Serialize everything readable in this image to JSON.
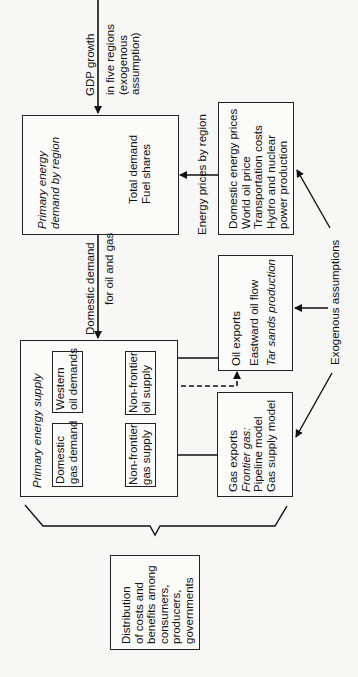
{
  "diagram": {
    "orientation": "rotated-90-counterclockwise",
    "gdp_input": {
      "lines": [
        "GDP growth",
        "in five regions",
        "(exogenous",
        "assumption)"
      ]
    },
    "primary_demand_box": {
      "title_lines": [
        "Primary energy",
        "demand by region"
      ],
      "body_lines": [
        "Total demand",
        "Fuel shares"
      ]
    },
    "energy_prices_label": "Energy prices by region",
    "prices_box": {
      "lines": [
        "Domestic energy prices",
        "World oil price",
        "Transportation costs",
        "Hydro and nuclear",
        "power production"
      ]
    },
    "domestic_demand_label": {
      "lines": [
        "Domestic demand",
        "for oil and gas"
      ]
    },
    "primary_supply_box": {
      "title": "Primary energy supply",
      "western_oil_demands": [
        "Western",
        "oil demands"
      ],
      "domestic_gas_demand": [
        "Domestic",
        "gas demand"
      ],
      "non_frontier_oil_supply": [
        "Non-frontier",
        "oil supply"
      ],
      "non_frontier_gas_supply": [
        "Non-frontier",
        "gas supply"
      ]
    },
    "oil_exports_box": {
      "line1": "Oil exports",
      "line2": "Eastward oil flow",
      "line3": "Tar sands production"
    },
    "gas_exports_box": {
      "line1": "Gas exports",
      "line2": "Frontier gas:",
      "line3": "Pipeline model",
      "line4": "Gas supply model"
    },
    "exogenous_label": "Exogenous assumptions",
    "output_box": {
      "lines": [
        "Distribution",
        "of costs and",
        "benefits among",
        "consumers,",
        "producers,",
        "governments"
      ]
    }
  }
}
